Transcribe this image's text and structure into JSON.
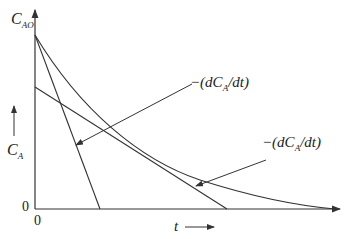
{
  "diagram": {
    "y_axis_label": "C",
    "y_axis_sub": "AO",
    "y_side_label": "C",
    "y_side_sub": "A",
    "origin_y": "0",
    "origin_x": "0",
    "x_axis_label": "t",
    "annot1": "−(dC",
    "annot1_sub": "A",
    "annot1_tail": "/dt)",
    "annot2": "−(dC",
    "annot2_sub": "A",
    "annot2_tail": "/dt)",
    "line_color": "#333333"
  }
}
